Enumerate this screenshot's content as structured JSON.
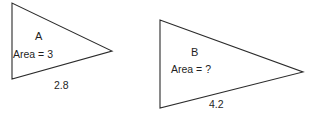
{
  "figure": {
    "background_color": "#ffffff",
    "stroke_color": "#2b2b2b",
    "text_color": "#1f1f1f",
    "width": 311,
    "height": 115,
    "shapes": [
      {
        "id": "triangle-a",
        "type": "triangle",
        "name": "A",
        "area_label": "Area = 3",
        "base_label": "2.8",
        "vertices": [
          [
            12,
            3
          ],
          [
            12,
            79
          ],
          [
            112,
            51
          ]
        ]
      },
      {
        "id": "triangle-b",
        "type": "triangle",
        "name": "B",
        "area_label": "Area = ?",
        "base_label": "4.2",
        "vertices": [
          [
            160,
            20
          ],
          [
            160,
            108
          ],
          [
            303,
            72
          ]
        ]
      }
    ]
  },
  "triangle_a": {
    "name": "A",
    "area": "Area = 3",
    "base": "2.8"
  },
  "triangle_b": {
    "name": "B",
    "area": "Area = ?",
    "base": "4.2"
  }
}
